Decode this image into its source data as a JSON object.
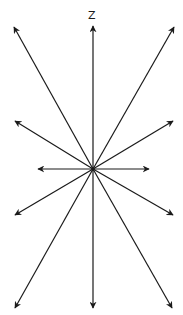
{
  "diagram": {
    "title": "",
    "axis_label": "Z",
    "stroke_color": "#1a1a1a",
    "background": "#ffffff",
    "center": [
      93,
      169
    ],
    "arrows": [
      {
        "name": "arrow-up",
        "tip": [
          93,
          26
        ]
      },
      {
        "name": "arrow-up-left",
        "tip": [
          14,
          27
        ]
      },
      {
        "name": "arrow-up-right",
        "tip": [
          174,
          27
        ]
      },
      {
        "name": "arrow-mid-left",
        "tip": [
          15,
          121
        ]
      },
      {
        "name": "arrow-mid-right",
        "tip": [
          173,
          121
        ]
      },
      {
        "name": "arrow-left",
        "tip": [
          38,
          169
        ]
      },
      {
        "name": "arrow-right",
        "tip": [
          149,
          169
        ]
      },
      {
        "name": "arrow-lower-left",
        "tip": [
          15,
          215
        ]
      },
      {
        "name": "arrow-lower-right",
        "tip": [
          173,
          215
        ]
      },
      {
        "name": "arrow-bottom-left",
        "tip": [
          15,
          308
        ]
      },
      {
        "name": "arrow-down",
        "tip": [
          93,
          308
        ]
      },
      {
        "name": "arrow-bottom-right",
        "tip": [
          172,
          308
        ]
      }
    ]
  }
}
